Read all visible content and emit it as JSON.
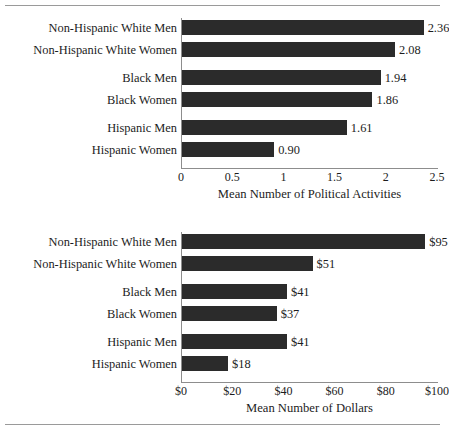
{
  "figure": {
    "background": "#ffffff",
    "bar_color": "#2b2b2b",
    "rule_color": "#9a9a9a",
    "axis_color": "#8d8d8d"
  },
  "chart_data": [
    {
      "type": "bar",
      "orientation": "horizontal",
      "title": "",
      "xlabel": "Mean Number of Political Activities",
      "ylabel": "",
      "xlim": [
        0,
        2.5
      ],
      "grid": false,
      "legend": "none",
      "categories": [
        "Non-Hispanic White Men",
        "Non-Hispanic White Women",
        "Black Men",
        "Black Women",
        "Hispanic Men",
        "Hispanic Women"
      ],
      "values": [
        2.36,
        2.08,
        1.94,
        1.86,
        1.61,
        0.9
      ],
      "value_labels": [
        "2.36",
        "2.08",
        "1.94",
        "1.86",
        "1.61",
        "0.90"
      ],
      "xticks": [
        0,
        0.5,
        1,
        1.5,
        2,
        2.5
      ],
      "xtick_labels": [
        "0",
        "0.5",
        "1",
        "1.5",
        "2",
        "2.5"
      ]
    },
    {
      "type": "bar",
      "orientation": "horizontal",
      "title": "",
      "xlabel": "Mean Number of Dollars",
      "ylabel": "",
      "xlim": [
        0,
        100
      ],
      "grid": false,
      "legend": "none",
      "categories": [
        "Non-Hispanic White Men",
        "Non-Hispanic White Women",
        "Black Men",
        "Black Women",
        "Hispanic Men",
        "Hispanic Women"
      ],
      "values": [
        95,
        51,
        41,
        37,
        41,
        18
      ],
      "value_labels": [
        "$95",
        "$51",
        "$41",
        "$37",
        "$41",
        "$18"
      ],
      "xticks": [
        0,
        20,
        40,
        60,
        80,
        100
      ],
      "xtick_labels": [
        "$0",
        "$20",
        "$40",
        "$60",
        "$80",
        "$100"
      ]
    }
  ]
}
